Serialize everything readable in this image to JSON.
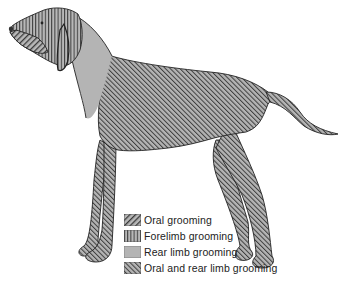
{
  "figure": {
    "regions": [
      {
        "id": "head",
        "category": "forelimb"
      },
      {
        "id": "muzzle",
        "category": "oral"
      },
      {
        "id": "neck",
        "category": "rear_limb"
      },
      {
        "id": "body",
        "category": "oral_and_rear_limb"
      },
      {
        "id": "legs",
        "category": "oral_and_rear_limb"
      },
      {
        "id": "tail",
        "category": "oral_and_rear_limb"
      }
    ]
  },
  "legend": {
    "items": [
      {
        "key": "oral",
        "label": "Oral grooming",
        "pattern": "diagonal-coarse"
      },
      {
        "key": "forelimb",
        "label": "Forelimb grooming",
        "pattern": "vertical"
      },
      {
        "key": "rear_limb",
        "label": "Rear limb grooming",
        "pattern": "solid"
      },
      {
        "key": "oral_and_rear_limb",
        "label": "Oral and rear limb grooming",
        "pattern": "diagonal-fine"
      }
    ]
  },
  "colors": {
    "fill_gray": "#b4b4b4",
    "stripe": "#3a3a3a",
    "outline": "#222222",
    "text": "#222222"
  }
}
